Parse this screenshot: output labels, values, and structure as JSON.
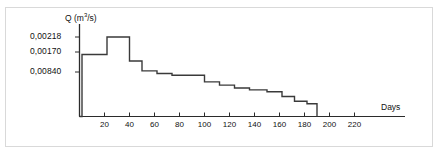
{
  "figure": {
    "name": "stepped-hydrograph",
    "frame_color": "#d9d9d9",
    "background": "#ffffff",
    "line_color": "#3a3a3a",
    "axis_color": "#2b2b2b"
  },
  "chart_data": {
    "type": "line",
    "title": "",
    "subtitle": "",
    "ylabel": "Q (m³/s)",
    "ylabel_prefix": "Q (m",
    "ylabel_exponent": "3",
    "ylabel_suffix": "/s)",
    "xlabel": "Days",
    "grid": false,
    "legend": null,
    "step_shape": "post",
    "xlim": [
      0,
      240
    ],
    "ylim": [
      0,
      0.0025
    ],
    "xticks": [
      20,
      40,
      60,
      80,
      100,
      120,
      140,
      160,
      180,
      200,
      220
    ],
    "xticklabels": [
      "20",
      "40",
      "60",
      "80",
      "100",
      "120",
      "140",
      "160",
      "180",
      "200",
      "220"
    ],
    "yticks": [
      0.00084,
      0.0017,
      0.00218
    ],
    "yticklabels": [
      "0,00840",
      "0,00170",
      "0,00218"
    ],
    "ytick_labels_ordered_top_down": [
      "0,00218",
      "0,00170",
      "0,00840"
    ],
    "decimal_separator": ",",
    "x": [
      0,
      2,
      2,
      22,
      22,
      40,
      40,
      50,
      50,
      62,
      62,
      74,
      74,
      100,
      100,
      112,
      112,
      124,
      124,
      136,
      136,
      150,
      150,
      162,
      162,
      172,
      172,
      182,
      182,
      190,
      190
    ],
    "y": [
      0.0,
      0.0,
      0.0017,
      0.0017,
      0.00218,
      0.00218,
      0.00152,
      0.00152,
      0.00125,
      0.00125,
      0.00118,
      0.00118,
      0.00113,
      0.00113,
      0.00095,
      0.00095,
      0.00086,
      0.00086,
      0.00078,
      0.00078,
      0.00073,
      0.00073,
      0.00068,
      0.00068,
      0.00055,
      0.00055,
      0.00042,
      0.00042,
      0.00035,
      0.00035,
      0.0
    ],
    "steps": [
      {
        "x_start": 0,
        "x_end": 2,
        "value": 0.0
      },
      {
        "x_start": 2,
        "x_end": 22,
        "value": 0.0017
      },
      {
        "x_start": 22,
        "x_end": 40,
        "value": 0.00218
      },
      {
        "x_start": 40,
        "x_end": 50,
        "value": 0.00152
      },
      {
        "x_start": 50,
        "x_end": 62,
        "value": 0.00125
      },
      {
        "x_start": 62,
        "x_end": 74,
        "value": 0.00118
      },
      {
        "x_start": 74,
        "x_end": 100,
        "value": 0.00113
      },
      {
        "x_start": 100,
        "x_end": 112,
        "value": 0.00095
      },
      {
        "x_start": 112,
        "x_end": 124,
        "value": 0.00086
      },
      {
        "x_start": 124,
        "x_end": 136,
        "value": 0.00078
      },
      {
        "x_start": 136,
        "x_end": 150,
        "value": 0.00073
      },
      {
        "x_start": 150,
        "x_end": 162,
        "value": 0.00068
      },
      {
        "x_start": 162,
        "x_end": 172,
        "value": 0.00055
      },
      {
        "x_start": 172,
        "x_end": 182,
        "value": 0.00042
      },
      {
        "x_start": 182,
        "x_end": 190,
        "value": 0.00035
      },
      {
        "x_start": 190,
        "x_end": 190,
        "value": 0.0
      }
    ]
  }
}
